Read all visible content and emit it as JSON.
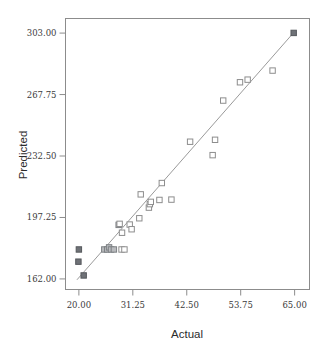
{
  "chart_data": {
    "type": "scatter",
    "title": "",
    "xlabel": "Actual",
    "ylabel": "Predicted",
    "xlim": [
      17.21,
      68.1
    ],
    "ylim": [
      155.94,
      311.37
    ],
    "grid": false,
    "legend": "none",
    "xticks": [
      "20.00",
      "31.25",
      "42.50",
      "53.75",
      "65.00"
    ],
    "xtick_values": [
      20.0,
      31.25,
      42.5,
      53.75,
      65.0
    ],
    "yticks": [
      "162.00",
      "197.25",
      "232.50",
      "267.75",
      "303.00"
    ],
    "ytick_values": [
      162.0,
      197.25,
      232.5,
      267.75,
      303.0
    ],
    "annotations": [],
    "series": [
      {
        "name": "Predicted vs Actual",
        "marker": "square",
        "points": [
          {
            "x": 19.9,
            "y": 171.9,
            "style": "filled"
          },
          {
            "x": 20.0,
            "y": 178.9,
            "style": "filled"
          },
          {
            "x": 21.0,
            "y": 164.0,
            "style": "filled"
          },
          {
            "x": 25.3,
            "y": 178.9,
            "style": "half"
          },
          {
            "x": 25.9,
            "y": 178.9,
            "style": "half"
          },
          {
            "x": 26.3,
            "y": 180.1,
            "style": "half"
          },
          {
            "x": 26.7,
            "y": 178.9,
            "style": "half"
          },
          {
            "x": 27.3,
            "y": 178.9,
            "style": "half"
          },
          {
            "x": 28.9,
            "y": 178.9,
            "style": "open"
          },
          {
            "x": 29.5,
            "y": 178.9,
            "style": "open"
          },
          {
            "x": 28.3,
            "y": 193.0,
            "style": "half"
          },
          {
            "x": 28.5,
            "y": 193.6,
            "style": "open"
          },
          {
            "x": 29.0,
            "y": 188.5,
            "style": "open"
          },
          {
            "x": 30.6,
            "y": 193.2,
            "style": "open"
          },
          {
            "x": 31.0,
            "y": 190.5,
            "style": "open"
          },
          {
            "x": 32.6,
            "y": 196.8,
            "style": "open"
          },
          {
            "x": 32.9,
            "y": 210.5,
            "style": "open"
          },
          {
            "x": 34.6,
            "y": 202.9,
            "style": "open"
          },
          {
            "x": 34.8,
            "y": 204.9,
            "style": "open"
          },
          {
            "x": 35.0,
            "y": 206.2,
            "style": "open"
          },
          {
            "x": 36.8,
            "y": 207.3,
            "style": "open"
          },
          {
            "x": 37.3,
            "y": 217.0,
            "style": "open"
          },
          {
            "x": 39.3,
            "y": 207.5,
            "style": "open"
          },
          {
            "x": 43.2,
            "y": 240.7,
            "style": "open"
          },
          {
            "x": 47.9,
            "y": 233.0,
            "style": "open"
          },
          {
            "x": 48.4,
            "y": 241.8,
            "style": "open"
          },
          {
            "x": 50.1,
            "y": 264.3,
            "style": "open"
          },
          {
            "x": 53.6,
            "y": 274.8,
            "style": "open"
          },
          {
            "x": 55.2,
            "y": 276.3,
            "style": "open"
          },
          {
            "x": 60.4,
            "y": 281.5,
            "style": "open"
          },
          {
            "x": 64.8,
            "y": 303.1,
            "style": "filled"
          }
        ]
      },
      {
        "name": "Fit line",
        "type": "line",
        "points": [
          {
            "x": 19.6,
            "y": 161.5
          },
          {
            "x": 64.8,
            "y": 303.3
          }
        ]
      }
    ]
  },
  "axes": {
    "x_title": "Actual",
    "y_title": "Predicted"
  }
}
